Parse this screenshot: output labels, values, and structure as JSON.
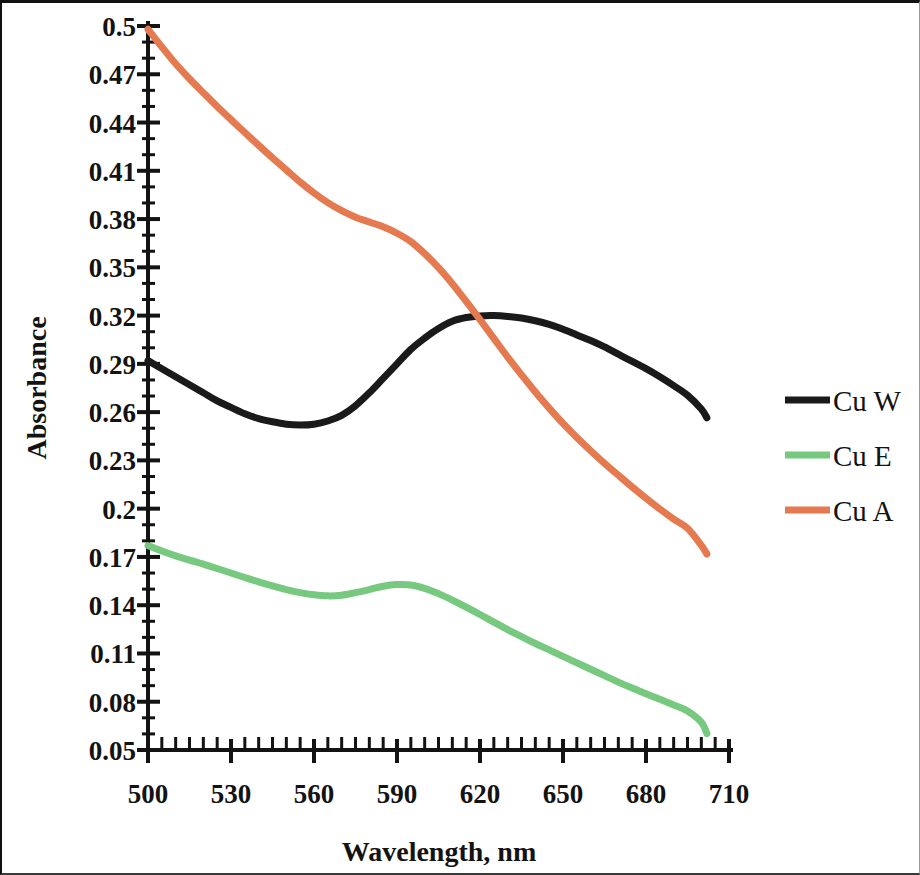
{
  "chart_data": {
    "type": "line",
    "title": "",
    "xlabel": "Wavelength, nm",
    "ylabel": "Absorbance",
    "xlim": [
      500,
      710
    ],
    "ylim": [
      0.05,
      0.5
    ],
    "xticks": [
      500,
      530,
      560,
      590,
      620,
      650,
      680,
      710
    ],
    "yticks": [
      0.05,
      0.08,
      0.11,
      0.14,
      0.17,
      0.2,
      0.23,
      0.26,
      0.29,
      0.32,
      0.35,
      0.38,
      0.41,
      0.44,
      0.47,
      0.5
    ],
    "xtick_labels": [
      "500",
      "530",
      "560",
      "590",
      "620",
      "650",
      "680",
      "710"
    ],
    "ytick_labels": [
      "0.05",
      "0.08",
      "0.11",
      "0.14",
      "0.17",
      "0.2",
      "0.23",
      "0.26",
      "0.29",
      "0.32",
      "0.35",
      "0.38",
      "0.41",
      "0.44",
      "0.47",
      "0.5"
    ],
    "x_minor_tick_step": 5,
    "y_minor_tick_step": 0.01,
    "grid": false,
    "legend_position": "right",
    "x": [
      500,
      505,
      510,
      515,
      520,
      525,
      530,
      535,
      540,
      545,
      550,
      555,
      560,
      565,
      570,
      575,
      580,
      585,
      590,
      595,
      600,
      605,
      610,
      615,
      620,
      625,
      630,
      635,
      640,
      645,
      650,
      655,
      660,
      665,
      670,
      675,
      680,
      685,
      690,
      695,
      700,
      702
    ],
    "series": [
      {
        "name": "Cu W",
        "color": "#1a1a1a",
        "values": [
          0.292,
          0.287,
          0.282,
          0.277,
          0.272,
          0.267,
          0.263,
          0.259,
          0.256,
          0.254,
          0.2525,
          0.252,
          0.2525,
          0.2545,
          0.258,
          0.264,
          0.272,
          0.281,
          0.29,
          0.299,
          0.306,
          0.312,
          0.3165,
          0.3188,
          0.3198,
          0.32,
          0.3195,
          0.3185,
          0.3168,
          0.3145,
          0.3115,
          0.308,
          0.3045,
          0.3005,
          0.296,
          0.2915,
          0.287,
          0.282,
          0.2765,
          0.2705,
          0.262,
          0.2565
        ]
      },
      {
        "name": "Cu E",
        "color": "#76c97f",
        "values": [
          0.177,
          0.1737,
          0.1707,
          0.168,
          0.1655,
          0.1628,
          0.16,
          0.1572,
          0.1545,
          0.152,
          0.1497,
          0.1478,
          0.1465,
          0.1458,
          0.1462,
          0.1478,
          0.1497,
          0.1518,
          0.1528,
          0.1525,
          0.1505,
          0.1472,
          0.1432,
          0.1388,
          0.1342,
          0.1295,
          0.1248,
          0.1205,
          0.1162,
          0.1122,
          0.1082,
          0.1042,
          0.1002,
          0.0962,
          0.0922,
          0.0885,
          0.085,
          0.0815,
          0.078,
          0.0742,
          0.0672,
          0.0602
        ]
      },
      {
        "name": "Cu A",
        "color": "#e5794f",
        "values": [
          0.498,
          0.487,
          0.4765,
          0.4672,
          0.4585,
          0.45,
          0.4418,
          0.4338,
          0.4258,
          0.418,
          0.4105,
          0.403,
          0.3962,
          0.3902,
          0.3852,
          0.3812,
          0.3782,
          0.3752,
          0.3712,
          0.366,
          0.3585,
          0.3498,
          0.3398,
          0.3288,
          0.3175,
          0.3058,
          0.2942,
          0.2832,
          0.2725,
          0.2625,
          0.253,
          0.2442,
          0.236,
          0.2282,
          0.2208,
          0.2135,
          0.2065,
          0.1998,
          0.1935,
          0.1878,
          0.1772,
          0.1718
        ]
      }
    ],
    "legend": [
      {
        "label": "Cu W",
        "color": "#1a1a1a"
      },
      {
        "label": "Cu E",
        "color": "#76c97f"
      },
      {
        "label": "Cu A",
        "color": "#e5794f"
      }
    ]
  }
}
